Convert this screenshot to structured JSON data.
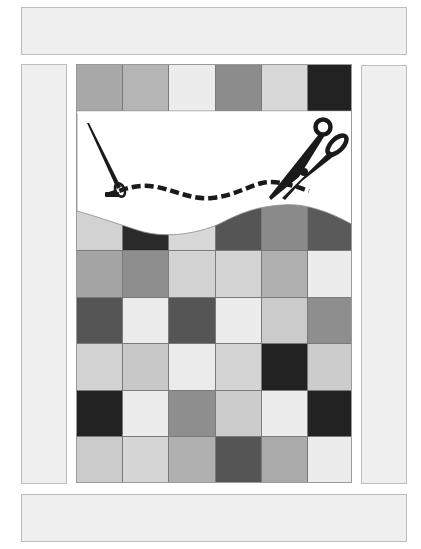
{
  "layout": {
    "top_bar": "blank-panel",
    "bottom_bar": "blank-panel",
    "left_panel": "blank-panel",
    "right_panel": "blank-panel"
  },
  "quilt": {
    "columns": 6,
    "row_height": 46.5,
    "rows": [
      {
        "top": 0,
        "colors": [
          "#a8a8a8",
          "#b5b5b5",
          "#ececec",
          "#8c8c8c",
          "#d8d8d8",
          "#222222"
        ]
      },
      {
        "top": 46.5,
        "colors": [
          "#ffffff",
          "#ffffff",
          "#ffffff",
          "#ffffff",
          "#ffffff",
          "#ffffff"
        ]
      },
      {
        "top": 93,
        "colors": [
          "#ffffff",
          "#ffffff",
          "#ffffff",
          "#ffffff",
          "#ffffff",
          "#ffffff"
        ]
      },
      {
        "top": 139.5,
        "colors": [
          "#d2d2d2",
          "#2a2a2a",
          "#d8d8d8",
          "#555555",
          "#8a8a8a",
          "#5a5a5a"
        ]
      },
      {
        "top": 186,
        "colors": [
          "#a4a4a4",
          "#8e8e8e",
          "#d2d2d2",
          "#d4d4d4",
          "#b0b0b0",
          "#ececec"
        ]
      },
      {
        "top": 232.5,
        "colors": [
          "#555555",
          "#ebebeb",
          "#555555",
          "#ececec",
          "#cbcbcb",
          "#8e8e8e"
        ]
      },
      {
        "top": 279,
        "colors": [
          "#d2d2d2",
          "#c8c8c8",
          "#ebebeb",
          "#d4d4d4",
          "#222222",
          "#cccccc"
        ]
      },
      {
        "top": 325.5,
        "colors": [
          "#222222",
          "#ececec",
          "#8e8e8e",
          "#cccccc",
          "#ececec",
          "#222222"
        ]
      },
      {
        "top": 372,
        "colors": [
          "#cbcbcb",
          "#d6d6d6",
          "#b0b0b0",
          "#555555",
          "#aaaaaa",
          "#ececec"
        ]
      }
    ]
  },
  "illustration": {
    "icons": [
      "needle-icon",
      "scissors-icon",
      "dashed-stitch-line",
      "wave-cutout"
    ],
    "ink_color": "#1a1a1a"
  }
}
